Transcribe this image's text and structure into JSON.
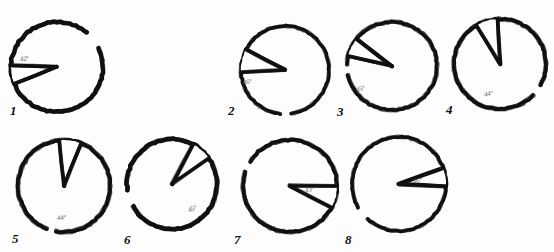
{
  "document": {
    "kind": "hand-drawn-geometry-worksheet",
    "title": "Hand-drawn circles with angular sectors",
    "background_color": "#fdfdfd",
    "ink_color": "#111111",
    "label_color": "#6b6b6b",
    "width": 554,
    "height": 252
  },
  "figures": [
    {
      "index": "1",
      "index_x": 10,
      "index_y": 104,
      "cx": 57,
      "cy": 67,
      "rx": 46,
      "ry": 45,
      "ray_a_deg": 158,
      "ray_b_deg": 182,
      "angle_label": "42",
      "label_x": 20,
      "label_y": 56,
      "label_rotate": -8,
      "gap_start_deg": 310,
      "gap_end_deg": 335
    },
    {
      "index": "2",
      "index_x": 228,
      "index_y": 104,
      "cx": 285,
      "cy": 70,
      "rx": 44,
      "ry": 44,
      "ray_a_deg": 177,
      "ray_b_deg": 208,
      "angle_label": "46",
      "label_x": 243,
      "label_y": 79,
      "label_rotate": -10,
      "gap_start_deg": 82,
      "gap_end_deg": 96
    },
    {
      "index": "3",
      "index_x": 337,
      "index_y": 105,
      "cx": 392,
      "cy": 66,
      "rx": 45,
      "ry": 44,
      "ray_a_deg": 193,
      "ray_b_deg": 218,
      "angle_label": "45",
      "label_x": 356,
      "label_y": 86,
      "label_rotate": -16,
      "gap_start_deg": 168,
      "gap_end_deg": 182
    },
    {
      "index": "4",
      "index_x": 446,
      "index_y": 103,
      "cx": 500,
      "cy": 64,
      "rx": 46,
      "ry": 45,
      "ray_a_deg": 239,
      "ray_b_deg": 267,
      "angle_label": "44",
      "label_x": 484,
      "label_y": 91,
      "label_rotate": -6,
      "gap_start_deg": 28,
      "gap_end_deg": 44
    },
    {
      "index": "5",
      "index_x": 12,
      "index_y": 232,
      "cx": 64,
      "cy": 186,
      "rx": 46,
      "ry": 46,
      "ray_a_deg": 264,
      "ray_b_deg": 292,
      "angle_label": "44",
      "label_x": 57,
      "label_y": 215,
      "label_rotate": -4,
      "gap_start_deg": 100,
      "gap_end_deg": 112
    },
    {
      "index": "6",
      "index_x": 124,
      "index_y": 233,
      "cx": 172,
      "cy": 184,
      "rx": 45,
      "ry": 45,
      "ray_a_deg": 298,
      "ray_b_deg": 325,
      "angle_label": "45",
      "label_x": 188,
      "label_y": 206,
      "label_rotate": -22,
      "gap_start_deg": 150,
      "gap_end_deg": 172
    },
    {
      "index": "7",
      "index_x": 234,
      "index_y": 233,
      "cx": 290,
      "cy": 186,
      "rx": 47,
      "ry": 46,
      "ray_a_deg": 0,
      "ray_b_deg": 28,
      "angle_label": "43",
      "label_x": 305,
      "label_y": 187,
      "label_rotate": -8,
      "gap_start_deg": 198,
      "gap_end_deg": 212
    },
    {
      "index": "8",
      "index_x": 345,
      "index_y": 233,
      "cx": 399,
      "cy": 184,
      "rx": 47,
      "ry": 47,
      "ray_a_deg": 340,
      "ray_b_deg": 3,
      "angle_label": "46",
      "label_x": 413,
      "label_y": 178,
      "label_rotate": -10,
      "gap_start_deg": 132,
      "gap_end_deg": 150
    }
  ]
}
